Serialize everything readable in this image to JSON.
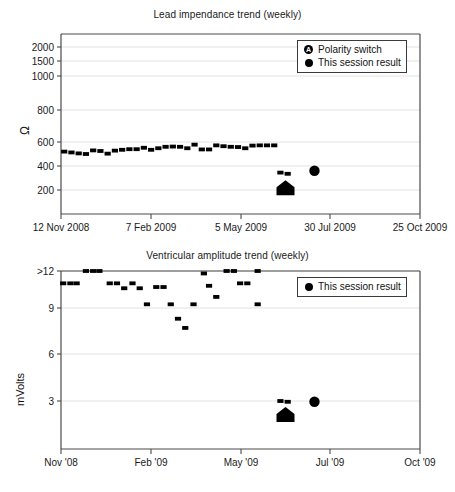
{
  "chart_data": [
    {
      "id": "lead-impedance",
      "type": "scatter",
      "title": "Lead impendance trend (weekly)",
      "xlabel": "",
      "ylabel": "Ω",
      "ylim": [
        0,
        2200
      ],
      "xlim": [
        0,
        347
      ],
      "grid": true,
      "legend_position": "top-right",
      "y_ticks": [
        {
          "label": "2000",
          "value": 2000
        },
        {
          "label": "1500",
          "value": 1500
        },
        {
          "label": "1000",
          "value": 1000
        },
        {
          "label": "800",
          "value": 800
        },
        {
          "label": "600",
          "value": 600
        },
        {
          "label": "400",
          "value": 400
        },
        {
          "label": "200",
          "value": 200
        }
      ],
      "x_ticks": [
        {
          "label": "12 Nov 2008",
          "value": 0
        },
        {
          "label": "7 Feb 2009",
          "value": 87
        },
        {
          "label": "5 May 2009",
          "value": 174
        },
        {
          "label": "30 Jul 2009",
          "value": 260
        },
        {
          "label": "25 Oct 2009",
          "value": 347
        }
      ],
      "legend": [
        {
          "label": "Polarity switch",
          "marker": "circle-a-icon"
        },
        {
          "label": "This session result",
          "marker": "circle-icon"
        }
      ],
      "series": [
        {
          "name": "Weekly lead impedance",
          "marker": "square",
          "points": [
            {
              "x": 3,
              "y": 520
            },
            {
              "x": 10,
              "y": 513
            },
            {
              "x": 17,
              "y": 505
            },
            {
              "x": 24,
              "y": 500
            },
            {
              "x": 31,
              "y": 530
            },
            {
              "x": 38,
              "y": 525
            },
            {
              "x": 45,
              "y": 503
            },
            {
              "x": 52,
              "y": 528
            },
            {
              "x": 59,
              "y": 535
            },
            {
              "x": 66,
              "y": 540
            },
            {
              "x": 73,
              "y": 540
            },
            {
              "x": 80,
              "y": 552
            },
            {
              "x": 87,
              "y": 535
            },
            {
              "x": 94,
              "y": 548
            },
            {
              "x": 101,
              "y": 560
            },
            {
              "x": 108,
              "y": 562
            },
            {
              "x": 115,
              "y": 560
            },
            {
              "x": 122,
              "y": 548
            },
            {
              "x": 129,
              "y": 578
            },
            {
              "x": 136,
              "y": 538
            },
            {
              "x": 143,
              "y": 538
            },
            {
              "x": 150,
              "y": 572
            },
            {
              "x": 157,
              "y": 565
            },
            {
              "x": 164,
              "y": 560
            },
            {
              "x": 171,
              "y": 558
            },
            {
              "x": 178,
              "y": 548
            },
            {
              "x": 185,
              "y": 570
            },
            {
              "x": 192,
              "y": 572
            },
            {
              "x": 199,
              "y": 572
            },
            {
              "x": 206,
              "y": 572
            },
            {
              "x": 212,
              "y": 345
            },
            {
              "x": 219,
              "y": 335
            }
          ]
        },
        {
          "name": "Polarity switch",
          "marker": "house",
          "points": [
            {
              "x": 217,
              "y": 215
            }
          ]
        },
        {
          "name": "This session result",
          "marker": "dot",
          "points": [
            {
              "x": 245,
              "y": 360
            }
          ]
        }
      ]
    },
    {
      "id": "ventricular-amplitude",
      "type": "scatter",
      "title": "Ventricular amplitude trend (weekly)",
      "xlabel": "",
      "ylabel": "mVolts",
      "ylim": [
        0,
        12.6
      ],
      "xlim": [
        0,
        347
      ],
      "grid": true,
      "legend_position": "top-right",
      "y_ticks": [
        {
          "label": ">12",
          "value": 12
        },
        {
          "label": "9",
          "value": 9
        },
        {
          "label": "6",
          "value": 6
        },
        {
          "label": "3",
          "value": 3
        }
      ],
      "x_ticks": [
        {
          "label": "Nov '08",
          "value": 0
        },
        {
          "label": "Feb '09",
          "value": 87
        },
        {
          "label": "May '09",
          "value": 174
        },
        {
          "label": "Jul '09",
          "value": 260
        },
        {
          "label": "Oct '09",
          "value": 347
        }
      ],
      "legend": [
        {
          "label": "This session result",
          "marker": "circle-icon"
        }
      ],
      "series": [
        {
          "name": "Weekly ventricular amplitude",
          "marker": "square",
          "points": [
            {
              "x": 2,
              "y": 11.0
            },
            {
              "x": 9,
              "y": 11.0
            },
            {
              "x": 15,
              "y": 11.0
            },
            {
              "x": 24,
              "y": 12.0
            },
            {
              "x": 31,
              "y": 12.0
            },
            {
              "x": 37,
              "y": 12.0
            },
            {
              "x": 47,
              "y": 11.0
            },
            {
              "x": 54,
              "y": 11.0
            },
            {
              "x": 61,
              "y": 10.6
            },
            {
              "x": 69,
              "y": 11.0
            },
            {
              "x": 76,
              "y": 10.6
            },
            {
              "x": 83,
              "y": 9.3
            },
            {
              "x": 92,
              "y": 10.7
            },
            {
              "x": 99,
              "y": 10.7
            },
            {
              "x": 106,
              "y": 9.3
            },
            {
              "x": 113,
              "y": 8.3
            },
            {
              "x": 120,
              "y": 7.7
            },
            {
              "x": 128,
              "y": 9.3
            },
            {
              "x": 138,
              "y": 11.8
            },
            {
              "x": 143,
              "y": 10.8
            },
            {
              "x": 150,
              "y": 9.9
            },
            {
              "x": 160,
              "y": 12.0
            },
            {
              "x": 167,
              "y": 12.0
            },
            {
              "x": 173,
              "y": 11.0
            },
            {
              "x": 180,
              "y": 11.0
            },
            {
              "x": 190,
              "y": 12.0
            },
            {
              "x": 190,
              "y": 9.3
            },
            {
              "x": 212,
              "y": 3.0
            },
            {
              "x": 219,
              "y": 2.95
            }
          ]
        },
        {
          "name": "Polarity switch",
          "marker": "house",
          "points": [
            {
              "x": 217,
              "y": 2.1
            }
          ]
        },
        {
          "name": "This session result",
          "marker": "dot",
          "points": [
            {
              "x": 245,
              "y": 2.95
            }
          ]
        }
      ]
    }
  ],
  "panels": {
    "impedance": {
      "title": "Lead impendance trend (weekly)",
      "ylabel": "Ω",
      "legend": {
        "polarity_label": "Polarity switch",
        "polarity_glyph": "A",
        "session_label": "This session result"
      },
      "y_tick_labels": [
        "2000",
        "1500",
        "1000",
        "800",
        "600",
        "400",
        "200"
      ],
      "x_tick_labels": [
        "12 Nov 2008",
        "7 Feb 2009",
        "5 May 2009",
        "30 Jul 2009",
        "25 Oct 2009"
      ]
    },
    "amplitude": {
      "title": "Ventricular amplitude trend (weekly)",
      "ylabel": "mVolts",
      "legend": {
        "session_label": "This session result"
      },
      "y_tick_labels": [
        ">12",
        "9",
        "6",
        "3"
      ],
      "x_tick_labels": [
        "Nov '08",
        "Feb '09",
        "May '09",
        "Jul '09",
        "Oct '09"
      ]
    }
  },
  "colors": {
    "marker": "#000000",
    "frame": "#4a4a4a",
    "grid": "#e2e2e2",
    "text": "#111111",
    "background": "#ffffff"
  }
}
